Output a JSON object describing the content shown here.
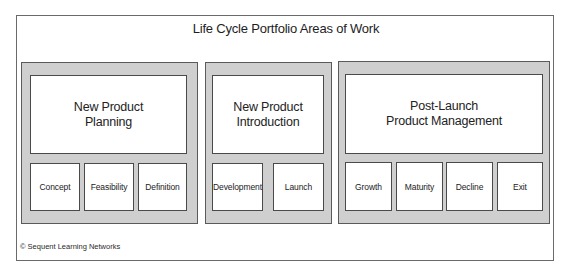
{
  "diagram": {
    "title": "Life Cycle Portfolio Areas of Work",
    "panels": [
      {
        "heading": "New Product\nPlanning",
        "phases": [
          "Concept",
          "Feasibility",
          "Definition"
        ]
      },
      {
        "heading": "New Product\nIntroduction",
        "phases": [
          "Development",
          "Launch"
        ]
      },
      {
        "heading": "Post-Launch\nProduct Management",
        "phases": [
          "Growth",
          "Maturity",
          "Decline",
          "Exit"
        ]
      }
    ],
    "copyright": "© Sequent Learning Networks"
  },
  "colors": {
    "panel_fill": "#cfcfcf",
    "box_fill": "#ffffff",
    "border": "#4a4a4a"
  }
}
